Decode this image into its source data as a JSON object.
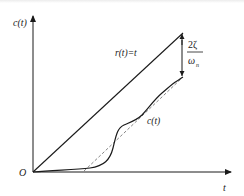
{
  "diagram": {
    "type": "ramp-response-plot",
    "y_axis_label": "c(t)",
    "x_axis_label": "t",
    "origin_label": "O",
    "input_line_label": "r(t)=t",
    "output_curve_label": "c(t)",
    "steady_state_error": {
      "numerator": "2ζ",
      "denominator": "ω",
      "denominator_subscript": "n"
    },
    "colors": {
      "line": "#1a1a1a",
      "dashed": "#777777",
      "background": "#ffffff"
    }
  }
}
